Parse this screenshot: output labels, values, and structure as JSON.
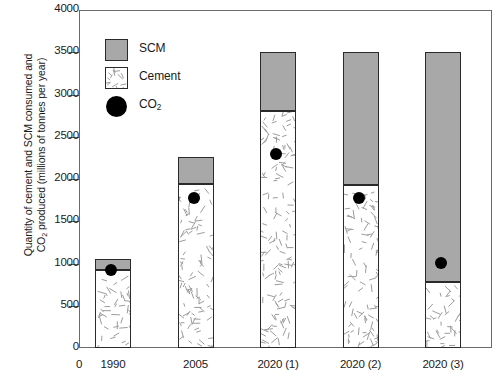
{
  "chart_data": {
    "type": "bar",
    "title": "",
    "xlabel": "",
    "ylabel": "Quantity of cement and SCM consumed and CO2 produced (millions of tonnes per year)",
    "ylabel_line1": "Quantity of cement and SCM consumed and",
    "ylabel_line2_pre": "CO",
    "ylabel_line2_sub": "2",
    "ylabel_line2_post": " produced (millions of tonnes per year)",
    "categories": [
      "1990",
      "2005",
      "2020 (1)",
      "2020 (2)",
      "2020 (3)"
    ],
    "stacked": true,
    "series": [
      {
        "name": "Cement",
        "values": [
          920,
          1940,
          2810,
          1930,
          780
        ]
      },
      {
        "name": "SCM",
        "values": [
          130,
          325,
          690,
          1570,
          2720
        ]
      }
    ],
    "totals": [
      1050,
      2265,
      3500,
      3500,
      3500
    ],
    "overlay": {
      "name": "CO2",
      "type": "scatter",
      "values": [
        925,
        1780,
        2300,
        1775,
        1010
      ]
    },
    "ylim": [
      0,
      4000
    ],
    "yticks": [
      0,
      500,
      1000,
      1500,
      2000,
      2500,
      3000,
      3500,
      4000
    ],
    "ytick_labels": [
      "0",
      "500",
      "1000",
      "1500",
      "2000",
      "2500",
      "3000",
      "3500",
      "4000"
    ],
    "xtick_labels": [
      "0",
      "1990",
      "2005",
      "2020 (1)",
      "2020 (2)",
      "2020 (3)"
    ],
    "grid": false,
    "legend_position": "top-left",
    "legend": [
      {
        "label": "SCM",
        "marker": "filled-square",
        "color": "#a8a8a8"
      },
      {
        "label": "Cement",
        "marker": "hatched-square",
        "color": "#ffffff"
      },
      {
        "label": "CO2",
        "marker": "filled-circle",
        "color": "#000000"
      }
    ],
    "colors": {
      "scm": "#a8a8a8",
      "cement": "#ffffff",
      "co2": "#000000",
      "axis": "#6a6a6a",
      "outline": "#2a2a2a"
    }
  }
}
